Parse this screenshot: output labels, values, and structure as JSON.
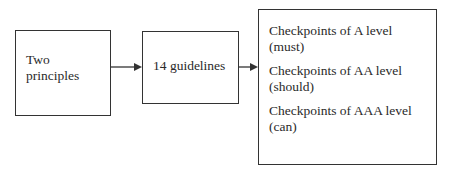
{
  "diagram": {
    "nodes": [
      {
        "id": "principles",
        "lines": [
          "Two",
          "principles"
        ]
      },
      {
        "id": "guidelines",
        "label": "14 guidelines"
      },
      {
        "id": "checkpoints",
        "items": [
          {
            "line1": "Checkpoints of A level",
            "line2": "(must)"
          },
          {
            "line1": "Checkpoints of AA level",
            "line2": "(should)"
          },
          {
            "line1": "Checkpoints of AAA level",
            "line2": "(can)"
          }
        ]
      }
    ],
    "edges": [
      {
        "from": "principles",
        "to": "guidelines"
      },
      {
        "from": "guidelines",
        "to": "checkpoints"
      }
    ]
  }
}
